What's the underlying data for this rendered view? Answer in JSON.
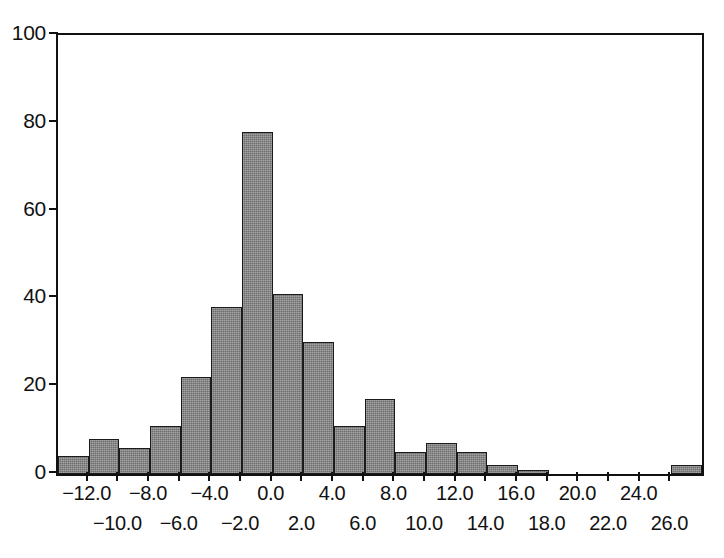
{
  "chart_data": {
    "type": "bar",
    "title": "",
    "subtitle": "",
    "xlabel": "",
    "ylabel": "",
    "legend": [],
    "grid": false,
    "xlim": [
      -14.0,
      28.0
    ],
    "ylim": [
      0,
      100
    ],
    "bin_width": 2.0,
    "categories": [
      "-14.0 to -12.0",
      "-12.0 to -10.0",
      "-10.0 to -8.0",
      "-8.0 to -6.0",
      "-6.0 to -4.0",
      "-4.0 to -2.0",
      "-2.0 to 0.0",
      "0.0 to 2.0",
      "2.0 to 4.0",
      "4.0 to 6.0",
      "6.0 to 8.0",
      "8.0 to 10.0",
      "10.0 to 12.0",
      "12.0 to 14.0",
      "14.0 to 16.0",
      "16.0 to 18.0",
      "18.0 to 20.0",
      "20.0 to 22.0",
      "22.0 to 24.0",
      "24.0 to 26.0",
      "26.0 to 28.0"
    ],
    "bin_starts": [
      -14.0,
      -12.0,
      -10.0,
      -8.0,
      -6.0,
      -4.0,
      -2.0,
      0.0,
      2.0,
      4.0,
      6.0,
      8.0,
      10.0,
      12.0,
      14.0,
      16.0,
      18.0,
      20.0,
      22.0,
      24.0,
      26.0
    ],
    "values": [
      4,
      8,
      6,
      11,
      22,
      38,
      78,
      41,
      30,
      11,
      17,
      5,
      7,
      5,
      2,
      1,
      0,
      0,
      0,
      0,
      2
    ],
    "y_ticks": [
      0,
      20,
      40,
      60,
      80,
      100
    ],
    "y_tick_labels": [
      "0",
      "20",
      "40",
      "60",
      "80",
      "100"
    ],
    "x_ticks": [
      -12.0,
      -10.0,
      -8.0,
      -6.0,
      -4.0,
      -2.0,
      0.0,
      2.0,
      4.0,
      6.0,
      8.0,
      10.0,
      12.0,
      14.0,
      16.0,
      18.0,
      20.0,
      22.0,
      24.0,
      26.0
    ],
    "x_tick_labels_upper": [
      "−12.0",
      "−8.0",
      "−4.0",
      "0.0",
      "4.0",
      "8.0",
      "12.0",
      "16.0",
      "20.0",
      "24.0"
    ],
    "x_tick_labels_upper_values": [
      -12.0,
      -8.0,
      -4.0,
      0.0,
      4.0,
      8.0,
      12.0,
      16.0,
      20.0,
      24.0
    ],
    "x_tick_labels_lower": [
      "−10.0",
      "−6.0",
      "−2.0",
      "2.0",
      "6.0",
      "10.0",
      "14.0",
      "18.0",
      "22.0",
      "26.0"
    ],
    "x_tick_labels_lower_values": [
      -10.0,
      -6.0,
      -2.0,
      2.0,
      6.0,
      10.0,
      14.0,
      18.0,
      22.0,
      26.0
    ],
    "bar_fill_color": "#6d6d6d",
    "bar_edge_color": "#1b1b1b",
    "axis_color": "#111111",
    "background_color": "#ffffff"
  }
}
